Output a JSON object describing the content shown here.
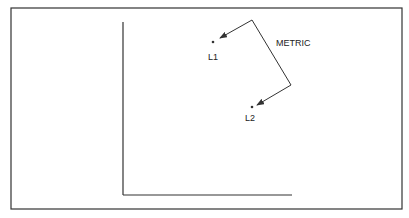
{
  "figure": {
    "labels": {
      "metric": "METRIC",
      "point1": "L1",
      "point2": "L2"
    },
    "colors": {
      "ink": "#333333",
      "background": "#ffffff"
    }
  }
}
